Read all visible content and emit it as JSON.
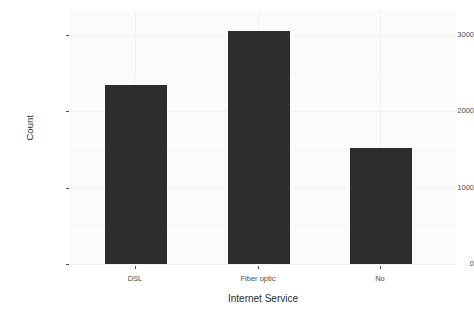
{
  "chart_data": {
    "type": "bar",
    "title": "",
    "subtitle": "",
    "xlabel": "Internet Service",
    "ylabel": "Count",
    "categories": [
      "DSL",
      "Fiber optic",
      "No"
    ],
    "values": [
      2345,
      3055,
      1520
    ],
    "series": [
      {
        "name": "Count",
        "values": [
          2345,
          3055,
          1520
        ]
      }
    ],
    "ylim": [
      0,
      3200
    ],
    "ytick_labels": [
      "0",
      "1000",
      "2000",
      "3000"
    ],
    "ytick_values": [
      0,
      1000,
      2000,
      3000
    ],
    "xtick_labels": [
      "DSL",
      "Fiber optic",
      "No"
    ],
    "grid": true,
    "legend": false,
    "legend_position": "none",
    "bar_color": "#2d2d2d",
    "panel_background": "#fbfbfb",
    "gridline_color": "#f2f2f2",
    "axis_text_color": "#4d4d4d",
    "axis_title_color": "#2b2b2b",
    "annotations": []
  },
  "axes": {
    "y": {
      "title": "Count",
      "ticks": [
        {
          "label": "3000",
          "value": 3000
        },
        {
          "label": "2000",
          "value": 2000
        },
        {
          "label": "1000",
          "value": 1000
        },
        {
          "label": "0",
          "value": 0
        }
      ]
    },
    "x": {
      "title": "Internet Service",
      "ticks": [
        {
          "label": "DSL"
        },
        {
          "label": "Fiber optic"
        },
        {
          "label": "No"
        }
      ]
    }
  }
}
